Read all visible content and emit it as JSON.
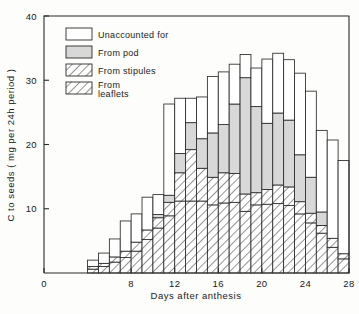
{
  "chart_data": {
    "type": "bar",
    "stacked": true,
    "title": "",
    "xlabel": "Days after anthesis",
    "ylabel": "C to seeds ( mg per 24h period )",
    "xlim": [
      0,
      28
    ],
    "ylim": [
      0,
      40
    ],
    "grid": false,
    "legend_position": "top-left",
    "xticks": [
      0,
      8,
      12,
      16,
      20,
      24,
      28
    ],
    "xtick_labels": [
      "0",
      "8",
      "12",
      "16",
      "20",
      "24",
      "28"
    ],
    "yticks": [
      10,
      20,
      30,
      40
    ],
    "ytick_labels": [
      "10",
      "20",
      "30",
      "40"
    ],
    "bar_width_days": 1,
    "categories": [
      4,
      5,
      6,
      7,
      8,
      9,
      10,
      11,
      12,
      13,
      14,
      15,
      16,
      17,
      18,
      19,
      20,
      21,
      22,
      23,
      24,
      25,
      26,
      27
    ],
    "series": [
      {
        "name": "From leaflets",
        "fill": "hatch-leaflets",
        "values": [
          0.6,
          1.0,
          1.7,
          2.4,
          3.4,
          5.2,
          7.0,
          8.9,
          11.2,
          11.2,
          11.2,
          10.6,
          10.9,
          11.0,
          9.6,
          10.6,
          10.7,
          10.8,
          10.5,
          9.2,
          7.8,
          6.2,
          4.0,
          2.2
        ]
      },
      {
        "name": "From stipules",
        "fill": "hatch-stipules",
        "values": [
          0.4,
          0.5,
          0.8,
          1.0,
          1.4,
          1.5,
          1.6,
          2.1,
          4.4,
          8.0,
          5.1,
          4.3,
          4.7,
          4.5,
          2.7,
          1.9,
          2.3,
          2.9,
          2.9,
          1.9,
          1.5,
          1.2,
          1.4,
          0.8
        ]
      },
      {
        "name": "From pod",
        "fill": "gray",
        "values": [
          0.0,
          0.0,
          0.0,
          0.0,
          0.0,
          0.0,
          0.5,
          1.1,
          3.0,
          4.2,
          4.6,
          6.9,
          7.5,
          10.8,
          18.1,
          13.4,
          10.3,
          11.2,
          10.4,
          7.3,
          5.6,
          2.1,
          0.0,
          0.0
        ]
      },
      {
        "name": "Unaccounted for",
        "fill": "white",
        "values": [
          1.0,
          1.6,
          2.8,
          4.7,
          4.4,
          5.1,
          3.1,
          14.2,
          8.6,
          3.8,
          6.5,
          8.8,
          8.2,
          6.2,
          3.6,
          6.0,
          10.0,
          9.3,
          9.4,
          12.7,
          13.4,
          12.7,
          15.3,
          14.5
        ]
      }
    ],
    "totals": [
      2.0,
      3.1,
      5.3,
      8.1,
      9.2,
      11.8,
      12.2,
      26.3,
      27.2,
      27.2,
      27.4,
      30.6,
      31.3,
      32.5,
      34.0,
      31.9,
      33.3,
      34.2,
      33.2,
      31.1,
      28.3,
      22.2,
      20.7,
      17.5
    ]
  },
  "legend": {
    "items": [
      {
        "label": "Unaccounted for",
        "fill": "white"
      },
      {
        "label": "From pod",
        "fill": "gray"
      },
      {
        "label": "From stipules",
        "fill": "hatch-stipules"
      },
      {
        "label": "From",
        "label2": "leaflets",
        "fill": "hatch-leaflets"
      }
    ]
  },
  "colors": {
    "axis": "#2b2b2b",
    "pod_fill": "#d8d8d8",
    "background": "#fdfdfc",
    "text": "#1a1a1a"
  }
}
